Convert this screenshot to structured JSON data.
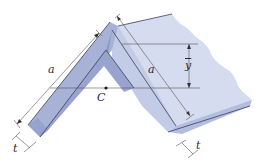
{
  "diagram": {
    "type": "engineering-figure",
    "labels": {
      "leg_length_left": "a",
      "leg_length_right": "a",
      "centroid": "C",
      "centroid_distance": "y",
      "thickness_left": "t",
      "thickness_right": "t"
    },
    "colors": {
      "face_light": "#c9d2ea",
      "face_mid": "#a7b2d6",
      "face_dark": "#8d99c6",
      "end_face": "#97a3cf",
      "top_surface": "#d5dcef",
      "edge": "#3a3f5c",
      "dimension_line": "#555555",
      "background": "#ffffff"
    }
  }
}
